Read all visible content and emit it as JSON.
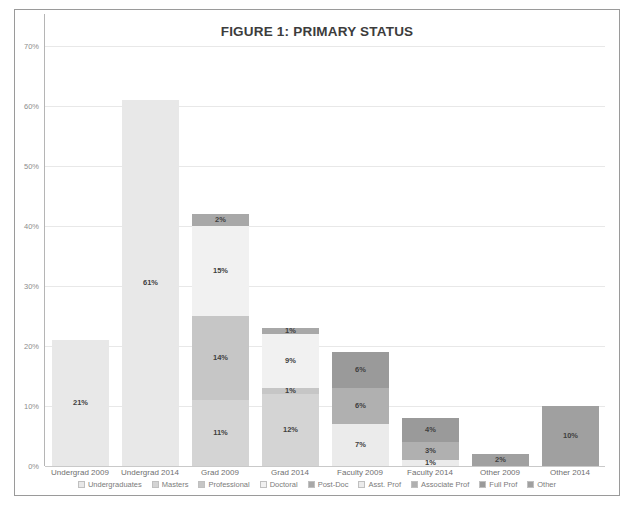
{
  "figure": {
    "title": "FIGURE 1: PRIMARY STATUS"
  },
  "axis": {
    "y_ticks": [
      "0%",
      "10%",
      "20%",
      "30%",
      "40%",
      "50%",
      "60%",
      "70%"
    ]
  },
  "chart_data": {
    "type": "bar",
    "subtype": "stacked-column",
    "title": "FIGURE 1: PRIMARY STATUS",
    "xlabel": "",
    "ylabel": "",
    "ylim": [
      0,
      70
    ],
    "ytick_step": 10,
    "ytick_labels": [
      "0%",
      "10%",
      "20%",
      "30%",
      "40%",
      "50%",
      "60%",
      "70%"
    ],
    "grid": true,
    "legend_position": "bottom",
    "value_suffix": "%",
    "categories": [
      "Undergrad 2009",
      "Undergrad 2014",
      "Grad 2009",
      "Grad 2014",
      "Faculty 2009",
      "Faculty 2014",
      "Other 2009",
      "Other 2014"
    ],
    "series": [
      {
        "name": "Undergraduates",
        "color": "#e8e8e8",
        "values": [
          21,
          61,
          0,
          0,
          0,
          0,
          0,
          0
        ],
        "labels": [
          "21%",
          "61%",
          "",
          "",
          "",
          "",
          "",
          ""
        ]
      },
      {
        "name": "Masters",
        "color": "#d4d4d4",
        "values": [
          0,
          0,
          11,
          12,
          0,
          0,
          0,
          0
        ],
        "labels": [
          "",
          "",
          "11%",
          "12%",
          "",
          "",
          "",
          ""
        ]
      },
      {
        "name": "Professional",
        "color": "#c6c6c6",
        "values": [
          0,
          0,
          14,
          1,
          0,
          0,
          0,
          0
        ],
        "labels": [
          "",
          "",
          "14%",
          "1%",
          "",
          "",
          "",
          ""
        ]
      },
      {
        "name": "Doctoral",
        "color": "#f1f1f1",
        "values": [
          0,
          0,
          15,
          9,
          0,
          0,
          0,
          0
        ],
        "labels": [
          "",
          "",
          "15%",
          "9%",
          "",
          "",
          "",
          ""
        ]
      },
      {
        "name": "Post-Doc",
        "color": "#a8a8a8",
        "values": [
          0,
          0,
          2,
          1,
          0,
          0,
          0,
          0
        ],
        "labels": [
          "",
          "",
          "2%",
          "1%",
          "",
          "",
          "",
          ""
        ]
      },
      {
        "name": "Asst. Prof",
        "color": "#ebebeb",
        "values": [
          0,
          0,
          0,
          0,
          7,
          1,
          0,
          0
        ],
        "labels": [
          "",
          "",
          "",
          "",
          "7%",
          "1%",
          "",
          ""
        ]
      },
      {
        "name": "Associate Prof",
        "color": "#b0b0b0",
        "values": [
          0,
          0,
          0,
          0,
          6,
          3,
          0,
          0
        ],
        "labels": [
          "",
          "",
          "",
          "",
          "6%",
          "3%",
          "",
          ""
        ]
      },
      {
        "name": "Full Prof",
        "color": "#9a9a9a",
        "values": [
          0,
          0,
          0,
          0,
          6,
          4,
          0,
          0
        ],
        "labels": [
          "",
          "",
          "",
          "",
          "6%",
          "4%",
          "",
          ""
        ]
      },
      {
        "name": "Other",
        "color": "#a0a0a0",
        "values": [
          0,
          0,
          0,
          0,
          0,
          0,
          2,
          10
        ],
        "labels": [
          "",
          "",
          "",
          "",
          "",
          "",
          "2%",
          "10%"
        ]
      }
    ],
    "totals": [
      21,
      61,
      42,
      23,
      19,
      8,
      2,
      10
    ]
  },
  "legend": {
    "items": [
      {
        "label": "Undergraduates",
        "color": "#e8e8e8"
      },
      {
        "label": "Masters",
        "color": "#d4d4d4"
      },
      {
        "label": "Professional",
        "color": "#c6c6c6"
      },
      {
        "label": "Doctoral",
        "color": "#f1f1f1"
      },
      {
        "label": "Post-Doc",
        "color": "#a8a8a8"
      },
      {
        "label": "Asst. Prof",
        "color": "#ebebeb"
      },
      {
        "label": "Associate Prof",
        "color": "#b0b0b0"
      },
      {
        "label": "Full Prof",
        "color": "#9a9a9a"
      },
      {
        "label": "Other",
        "color": "#a0a0a0"
      }
    ]
  }
}
